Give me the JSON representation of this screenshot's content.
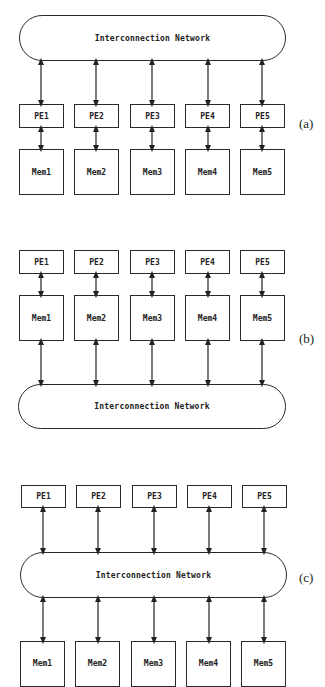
{
  "diagrams": [
    {
      "id": "a",
      "label": "(a)",
      "network_label": "Interconnection Network",
      "pe_labels": [
        "PE1",
        "PE2",
        "PE3",
        "PE4",
        "PE5"
      ],
      "mem_labels": [
        "Mem1",
        "Mem2",
        "Mem3",
        "Mem4",
        "Mem5"
      ],
      "connections": "Interconnection Network <-> PE_i <-> Mem_i"
    },
    {
      "id": "b",
      "label": "(b)",
      "network_label": "Interconnection Network",
      "pe_labels": [
        "PE1",
        "PE2",
        "PE3",
        "PE4",
        "PE5"
      ],
      "mem_labels": [
        "Mem1",
        "Mem2",
        "Mem3",
        "Mem4",
        "Mem5"
      ],
      "connections": "PE_i <-> Mem_i <-> Interconnection Network"
    },
    {
      "id": "c",
      "label": "(c)",
      "network_label": "Interconnection Network",
      "pe_labels": [
        "PE1",
        "PE2",
        "PE3",
        "PE4",
        "PE5"
      ],
      "mem_labels": [
        "Mem1",
        "Mem2",
        "Mem3",
        "Mem4",
        "Mem5"
      ],
      "connections": "PE_i <-> Interconnection Network <-> Mem_i"
    }
  ]
}
